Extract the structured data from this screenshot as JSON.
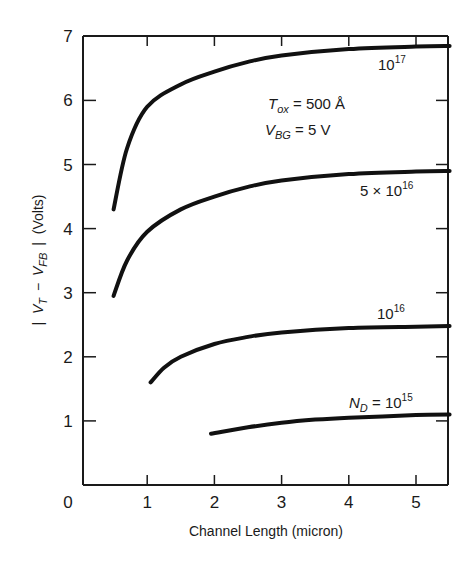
{
  "chart_data": {
    "type": "line",
    "title": "",
    "xlabel": "Channel Length (micron)",
    "ylabel": "| V_T − V_FB | (Volts)",
    "ylabel_parts": {
      "bar_left": "|",
      "v1": "V",
      "v1_sub": "T",
      "minus": "−",
      "v2": "V",
      "v2_sub": "FB",
      "bar_right": "|",
      "units": "(Volts)"
    },
    "xlim": [
      0,
      5.5
    ],
    "ylim": [
      0,
      7
    ],
    "x_ticks": [
      "0",
      "1",
      "2",
      "3",
      "4",
      "5"
    ],
    "y_ticks": [
      "1",
      "2",
      "3",
      "4",
      "5",
      "6",
      "7"
    ],
    "grid": false,
    "legend": "inline labels",
    "annotations": [
      {
        "text": "T_ox = 500 Å",
        "parts": {
          "sym": "T",
          "sub": "ox",
          "rest": " = 500 Å"
        }
      },
      {
        "text": "V_BG = 5 V",
        "parts": {
          "sym": "V",
          "sub": "BG",
          "rest": " = 5 V"
        }
      }
    ],
    "series": [
      {
        "name": "10^17",
        "label": {
          "base": "10",
          "exp": "17"
        },
        "x": [
          0.5,
          0.7,
          1.0,
          1.5,
          2.0,
          2.5,
          3.0,
          4.0,
          5.0,
          5.5
        ],
        "y": [
          4.3,
          5.25,
          5.9,
          6.25,
          6.45,
          6.6,
          6.7,
          6.8,
          6.84,
          6.85
        ]
      },
      {
        "name": "5 × 10^16",
        "label": {
          "base": "5 × 10",
          "exp": "16"
        },
        "x": [
          0.5,
          0.7,
          1.0,
          1.5,
          2.0,
          2.5,
          3.0,
          4.0,
          5.0,
          5.5
        ],
        "y": [
          2.95,
          3.5,
          3.95,
          4.3,
          4.5,
          4.65,
          4.75,
          4.85,
          4.89,
          4.9
        ]
      },
      {
        "name": "10^16",
        "label": {
          "base": "10",
          "exp": "16"
        },
        "x": [
          1.05,
          1.25,
          1.5,
          2.0,
          2.5,
          3.0,
          4.0,
          5.0,
          5.5
        ],
        "y": [
          1.6,
          1.83,
          2.0,
          2.2,
          2.31,
          2.38,
          2.45,
          2.47,
          2.48
        ]
      },
      {
        "name": "N_D = 10^15",
        "label": {
          "sym": "N",
          "sub": "D",
          "eq": " = 10",
          "exp": "15"
        },
        "x": [
          1.95,
          2.5,
          3.0,
          3.5,
          4.0,
          4.5,
          5.0,
          5.5
        ],
        "y": [
          0.8,
          0.9,
          0.97,
          1.02,
          1.05,
          1.07,
          1.09,
          1.1
        ]
      }
    ]
  }
}
